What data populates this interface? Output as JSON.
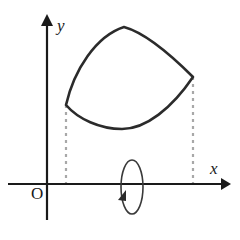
{
  "figure": {
    "background_color": "#ffffff",
    "axes": {
      "color": "#1a1a1a",
      "stroke_width": 2.2,
      "origin": {
        "x": 47,
        "y": 184,
        "label": "O"
      },
      "x_axis": {
        "label": "x",
        "start_x": 8,
        "end_x": 228,
        "y": 184,
        "arrow": "right-arrowhead",
        "label_position": {
          "x": 210,
          "y": 160
        }
      },
      "y_axis": {
        "label": "y",
        "x": 47,
        "start_y": 220,
        "end_y": 16,
        "arrow": "up-arrowhead",
        "label_position": {
          "x": 57,
          "y": 17
        }
      }
    },
    "curve": {
      "name": "closed-region-outline",
      "color": "#2b2b2b",
      "stroke_width": 2.6,
      "fill": "none",
      "left_vertex": {
        "x": 66,
        "y": 105
      },
      "right_vertex": {
        "x": 193,
        "y": 77
      },
      "top_apex": {
        "x": 124,
        "y": 27
      },
      "bottom_min": {
        "x": 122,
        "y": 129
      },
      "path": "M 66 105 C 74 70, 96 36, 124 27 C 146 33, 172 56, 193 77 C 172 108, 146 129, 122 129 C 100 129, 78 119, 66 105 Z"
    },
    "dashed_lines": {
      "color": "#a8a8a8",
      "stroke_width": 2.2,
      "dash_pattern": "3 4",
      "left": {
        "x": 66,
        "y_top": 105,
        "y_bottom": 184
      },
      "right": {
        "x": 193,
        "y_top": 77,
        "y_bottom": 184
      }
    },
    "rotation_indicator": {
      "name": "revolution-arrow",
      "color": "#3a3a3a",
      "stroke_width": 1.6,
      "center": {
        "x": 132,
        "y": 187
      },
      "rx": 11,
      "ry": 27,
      "arrowhead": {
        "x": 122,
        "y": 197,
        "direction": "down-left"
      },
      "meaning": "rotation about the x-axis"
    }
  }
}
